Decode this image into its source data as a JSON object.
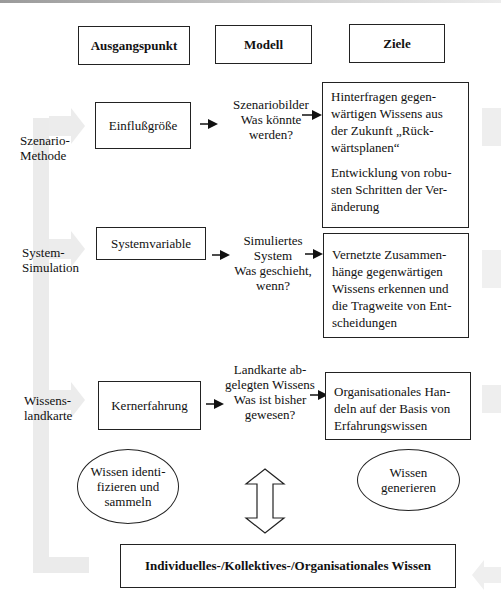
{
  "headers": {
    "start": "Ausgangspunkt",
    "model": "Modell",
    "goals": "Ziele"
  },
  "rows": [
    {
      "label_line1": "Szenario-",
      "label_line2": "Methode",
      "start": "Einflußgröße",
      "model_lines": [
        "Szenariobilder",
        "Was könnte",
        "werden?"
      ],
      "goal_paragraphs": [
        [
          "Hinterfragen gegen-",
          "wärtigen Wissens aus",
          "der Zukunft „Rück-",
          "wärtsplanen“"
        ],
        [
          "Entwicklung von robu-",
          "sten Schritten der Ver-",
          "änderung"
        ]
      ]
    },
    {
      "label_line1": "System-",
      "label_line2": "Simulation",
      "start": "Systemvariable",
      "model_lines": [
        "Simuliertes",
        "System",
        "Was geschieht,",
        "wenn?"
      ],
      "goal_paragraphs": [
        [
          "Vernetzte Zusammen-",
          "hänge gegenwärtigen",
          "Wissens erkennen und",
          "die Tragweite von Ent-",
          "scheidungen"
        ]
      ]
    },
    {
      "label_line1": "Wissens-",
      "label_line2": "landkarte",
      "start": "Kernerfahrung",
      "model_lines": [
        "Landkarte ab-",
        "gelegten Wissens",
        "Was ist bisher",
        "gewesen?"
      ],
      "goal_paragraphs": [
        [
          "Organisationales Han-",
          "deln auf der Basis von",
          "Erfahrungswissen"
        ]
      ]
    }
  ],
  "ellipses": {
    "left_lines": [
      "Wissen identi-",
      "fizieren und",
      "sammeln"
    ],
    "right_lines": [
      "Wissen",
      "generieren"
    ]
  },
  "bottom_box": "Individuelles-/Kollektives-/Organisationales Wissen",
  "icons": {
    "row_arrow": "right-arrow-icon",
    "double_arrow": "up-down-double-arrow-icon"
  },
  "colors": {
    "line": "#222222",
    "gray_flow": "#ebebeb"
  }
}
